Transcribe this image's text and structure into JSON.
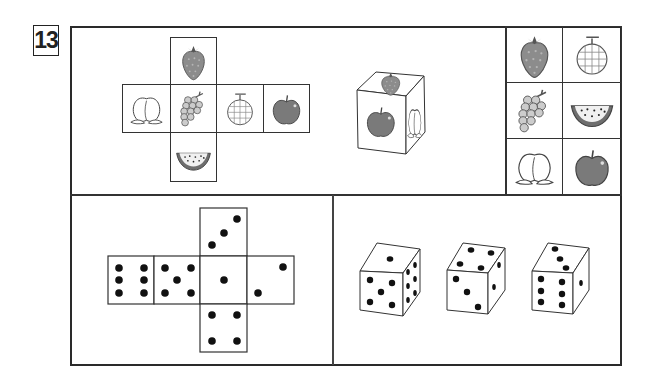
{
  "question": {
    "number": "13"
  },
  "fruit_puzzle": {
    "net": {
      "top": "strawberry",
      "middle_row": [
        "peach",
        "grapes",
        "melon",
        "apple"
      ],
      "bottom": "watermelon"
    },
    "cube_view": {
      "top": "strawberry",
      "front": "apple",
      "right": "peach"
    },
    "choices": [
      [
        "strawberry",
        "melon"
      ],
      [
        "grapes",
        "watermelon"
      ],
      [
        "peach",
        "apple"
      ]
    ]
  },
  "dice_puzzle": {
    "net": {
      "top": 3,
      "middle_row": [
        6,
        5,
        1,
        2
      ],
      "bottom": 4
    },
    "dice_views": [
      {
        "top": 1,
        "front": 5,
        "right": 6
      },
      {
        "top": 4,
        "front": 3,
        "right": 2
      },
      {
        "top": 3,
        "front": 6,
        "right": 1
      }
    ]
  },
  "colors": {
    "line": "#2a2a2a",
    "fruit_fill": "#8c8c8c",
    "apple_fill": "#7a7a7a",
    "pip": "#111111"
  }
}
